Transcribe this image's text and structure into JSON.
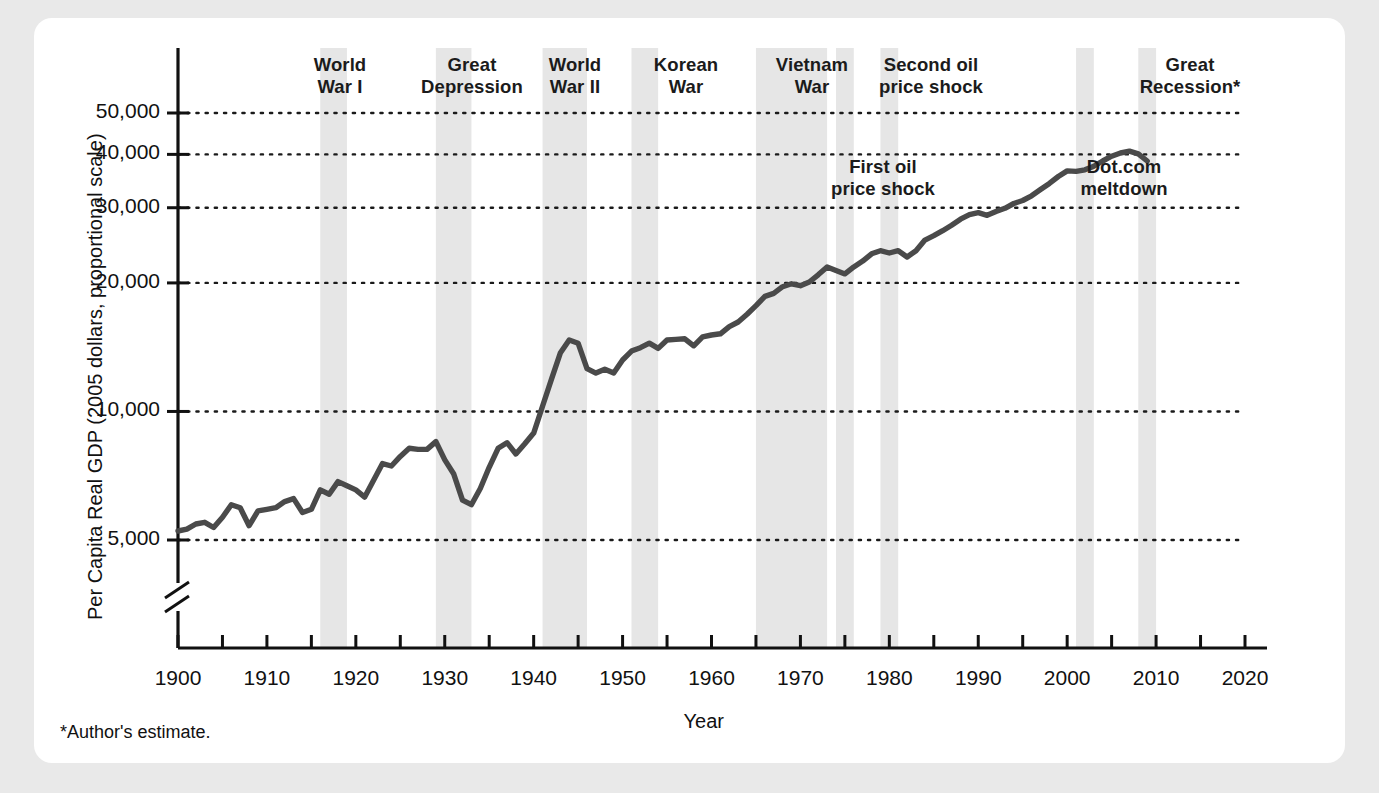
{
  "figure": {
    "footnote": "*Author's estimate.",
    "line_color": "#4a4a4a",
    "band_color": "#e6e6e6",
    "axis_color": "#111111",
    "card_color": "#ffffff",
    "page_color": "#e9e9e9"
  },
  "chart_data": {
    "type": "line",
    "title": "",
    "xlabel": "Year",
    "ylabel": "Per Capita Real GDP (2005 dollars, proportional scale)",
    "yscale": "log",
    "y_axis_note": "proportional scale",
    "axis_break": true,
    "grid": "horizontal dotted at each labeled y tick",
    "legend": "none",
    "xlim": [
      1900,
      2020
    ],
    "ylim": [
      4200,
      58000
    ],
    "xticks": [
      1900,
      1910,
      1920,
      1930,
      1940,
      1950,
      1960,
      1970,
      1980,
      1990,
      2000,
      2010,
      2020
    ],
    "xticklabels": [
      "1900",
      "1910",
      "1920",
      "1930",
      "1940",
      "1950",
      "1960",
      "1970",
      "1980",
      "1990",
      "2000",
      "2010",
      "2020"
    ],
    "xminorticks": [
      1905,
      1915,
      1925,
      1935,
      1945,
      1955,
      1965,
      1975,
      1985,
      1995,
      2005,
      2015
    ],
    "yticks": [
      5000,
      10000,
      20000,
      30000,
      40000,
      50000
    ],
    "yticklabels": [
      "5,000",
      "10,000",
      "20,000",
      "30,000",
      "40,000",
      "50,000"
    ],
    "series": [
      {
        "name": "Per Capita Real GDP",
        "x": [
          1900,
          1901,
          1902,
          1903,
          1904,
          1905,
          1906,
          1907,
          1908,
          1909,
          1910,
          1911,
          1912,
          1913,
          1914,
          1915,
          1916,
          1917,
          1918,
          1919,
          1920,
          1921,
          1922,
          1923,
          1924,
          1925,
          1926,
          1927,
          1928,
          1929,
          1930,
          1931,
          1932,
          1933,
          1934,
          1935,
          1936,
          1937,
          1938,
          1939,
          1940,
          1941,
          1942,
          1943,
          1944,
          1945,
          1946,
          1947,
          1948,
          1949,
          1950,
          1951,
          1952,
          1953,
          1954,
          1955,
          1956,
          1957,
          1958,
          1959,
          1960,
          1961,
          1962,
          1963,
          1964,
          1965,
          1966,
          1967,
          1968,
          1969,
          1970,
          1971,
          1972,
          1973,
          1974,
          1975,
          1976,
          1977,
          1978,
          1979,
          1980,
          1981,
          1982,
          1983,
          1984,
          1985,
          1986,
          1987,
          1988,
          1989,
          1990,
          1991,
          1992,
          1993,
          1994,
          1995,
          1996,
          1997,
          1998,
          1999,
          2000,
          2001,
          2002,
          2003,
          2004,
          2005,
          2006,
          2007,
          2008,
          2009
        ],
        "values": [
          5250,
          5300,
          5450,
          5500,
          5350,
          5650,
          6050,
          5950,
          5400,
          5850,
          5900,
          5950,
          6150,
          6250,
          5800,
          5900,
          6550,
          6400,
          6850,
          6700,
          6550,
          6300,
          6900,
          7550,
          7450,
          7850,
          8200,
          8150,
          8150,
          8500,
          7700,
          7150,
          6200,
          6050,
          6600,
          7400,
          8200,
          8450,
          7950,
          8400,
          8900,
          10300,
          11900,
          13700,
          14700,
          14450,
          12600,
          12300,
          12550,
          12300,
          13200,
          13850,
          14100,
          14450,
          14050,
          14700,
          14750,
          14800,
          14250,
          14950,
          15100,
          15200,
          15800,
          16200,
          16900,
          17700,
          18600,
          18900,
          19600,
          19900,
          19700,
          20100,
          20900,
          21800,
          21400,
          21000,
          21800,
          22500,
          23400,
          23800,
          23500,
          23800,
          23000,
          23800,
          25200,
          25800,
          26500,
          27300,
          28200,
          28900,
          29200,
          28800,
          29400,
          29900,
          30700,
          31200,
          32000,
          33100,
          34200,
          35500,
          36600,
          36500,
          36800,
          37500,
          38600,
          39600,
          40300,
          40700,
          40100,
          38600
        ]
      }
    ],
    "event_bands": [
      {
        "label": "World War I",
        "start": 1916,
        "end": 1919
      },
      {
        "label": "Great Depression",
        "start": 1929,
        "end": 1933
      },
      {
        "label": "World War II",
        "start": 1941,
        "end": 1946
      },
      {
        "label": "Korean War",
        "start": 1951,
        "end": 1954
      },
      {
        "label": "Vietnam War",
        "start": 1965,
        "end": 1973
      },
      {
        "label": "First oil price shock",
        "start": 1974,
        "end": 1976
      },
      {
        "label": "Second oil price shock",
        "start": 1979,
        "end": 1981
      },
      {
        "label": "Dot.com meltdown",
        "start": 2001,
        "end": 2003
      },
      {
        "label": "Great Recession*",
        "start": 2008,
        "end": 2010
      }
    ],
    "annotations": [
      {
        "name": "world-war-i",
        "text": "World\nWar I",
        "x_px": 340,
        "y_px": 54,
        "position": "top"
      },
      {
        "name": "great-depression",
        "text": "Great\nDepression",
        "x_px": 472,
        "y_px": 54,
        "position": "top"
      },
      {
        "name": "world-war-ii",
        "text": "World\nWar II",
        "x_px": 575,
        "y_px": 54,
        "position": "top"
      },
      {
        "name": "korean-war",
        "text": "Korean\nWar",
        "x_px": 686,
        "y_px": 54,
        "position": "top"
      },
      {
        "name": "vietnam-war",
        "text": "Vietnam\nWar",
        "x_px": 812,
        "y_px": 54,
        "position": "top"
      },
      {
        "name": "second-oil-price-shock",
        "text": "Second oil\nprice shock",
        "x_px": 931,
        "y_px": 54,
        "position": "top"
      },
      {
        "name": "great-recession",
        "text": "Great\nRecession*",
        "x_px": 1190,
        "y_px": 54,
        "position": "top"
      },
      {
        "name": "first-oil-price-shock",
        "text": "First oil\nprice shock",
        "x_px": 883,
        "y_px": 156,
        "position": "inner"
      },
      {
        "name": "dot-com-meltdown",
        "text": "Dot.com\nmeltdown",
        "x_px": 1124,
        "y_px": 156,
        "position": "inner"
      }
    ]
  }
}
